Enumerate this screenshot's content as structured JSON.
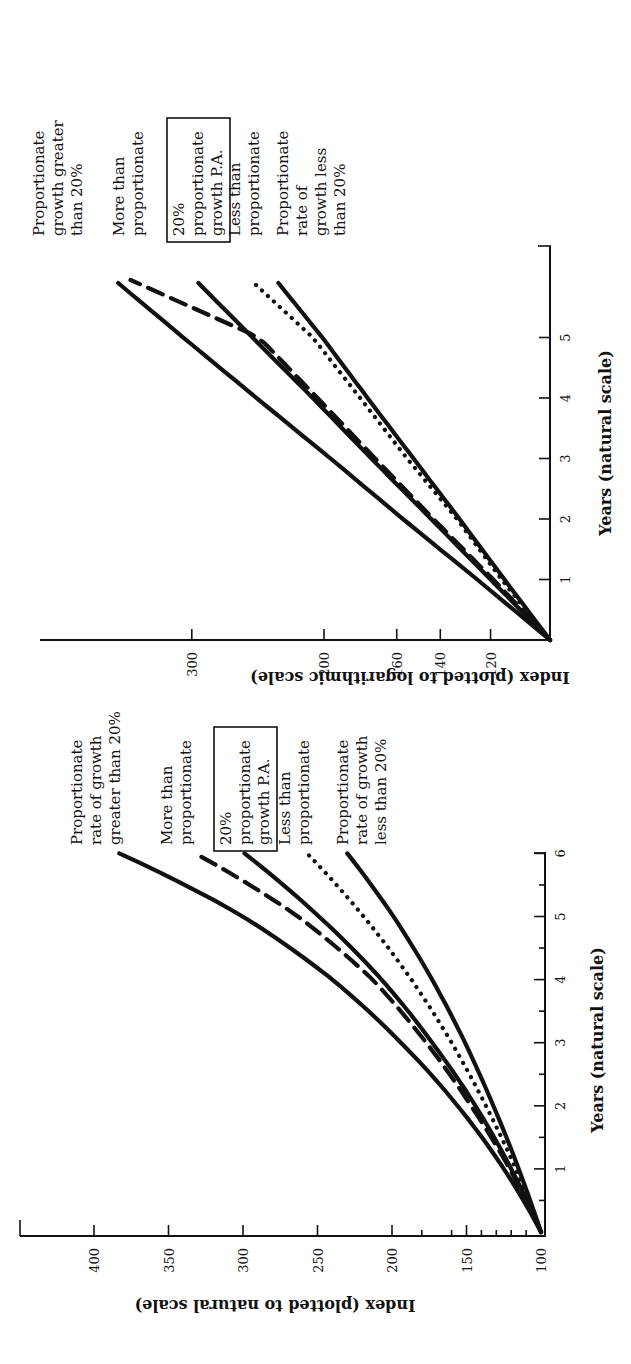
{
  "chart_data": [
    {
      "id": "log-chart",
      "type": "line",
      "title": "",
      "xlabel": "Years (natural scale)",
      "ylabel": "Index (plotted to logarithmic scale)",
      "x_ticks": [
        "1",
        "2",
        "3",
        "4",
        "5"
      ],
      "x_range": [
        0,
        6
      ],
      "y_scale": "log",
      "y_ticks": [
        "120",
        "140",
        "160",
        "200",
        "300"
      ],
      "y_tick_values": [
        120,
        140,
        160,
        200,
        300
      ],
      "y_range": [
        100,
        550
      ],
      "grid": false,
      "orientation": "rotated 90° counter-clockwise on page",
      "series": [
        {
          "name": "Proportionate growth greater than 20%",
          "style": "solid",
          "x": [
            0,
            1,
            2,
            3,
            4,
            5,
            5.9
          ],
          "values": [
            100,
            125,
            157,
            196,
            246,
            308,
            376
          ]
        },
        {
          "name": "More than proportionate",
          "style": "dashed",
          "x": [
            0,
            1,
            2,
            3,
            4,
            5,
            5.95
          ],
          "values": [
            100,
            119,
            143,
            171,
            204,
            244,
            362
          ]
        },
        {
          "name": "20% proportionate growth P.A.",
          "style": "solid",
          "x": [
            0,
            1,
            2,
            3,
            4,
            5,
            5.9
          ],
          "values": [
            100,
            120,
            144,
            173,
            207,
            249,
            294
          ]
        },
        {
          "name": "Less than proportionate",
          "style": "dotted",
          "x": [
            0,
            1,
            2,
            3,
            4,
            5,
            5.9
          ],
          "values": [
            100,
            116,
            133,
            155,
            179,
            207,
            248
          ]
        },
        {
          "name": "Proportionate rate of growth less than 20%",
          "style": "solid",
          "x": [
            0,
            1,
            2,
            3,
            4,
            5,
            5.9
          ],
          "values": [
            100,
            115,
            132,
            152,
            175,
            201,
            230
          ]
        }
      ],
      "labels": [
        {
          "lines": [
            "Proportionate",
            "growth greater",
            "than 20%"
          ],
          "boxed": false
        },
        {
          "lines": [
            "More than",
            "proportionate"
          ],
          "boxed": false
        },
        {
          "lines": [
            "20%",
            "proportionate",
            "growth P.A."
          ],
          "boxed": true
        },
        {
          "lines": [
            "Less than",
            "proportionate"
          ],
          "boxed": false
        },
        {
          "lines": [
            "Proportionate",
            "rate of",
            "growth less",
            "than 20%"
          ],
          "boxed": false
        }
      ]
    },
    {
      "id": "natural-chart",
      "type": "line",
      "title": "",
      "xlabel": "Years (natural scale)",
      "ylabel": "Index (plotted to natural scale)",
      "x_ticks": [
        "1",
        "2",
        "3",
        "4",
        "5",
        "6"
      ],
      "x_range": [
        0,
        6
      ],
      "y_scale": "linear",
      "y_ticks": [
        "100",
        "150",
        "200",
        "250",
        "300",
        "350",
        "400"
      ],
      "y_tick_values": [
        100,
        150,
        200,
        250,
        300,
        350,
        400
      ],
      "y_range": [
        100,
        430
      ],
      "grid": false,
      "orientation": "rotated 90° counter-clockwise on page",
      "series": [
        {
          "name": "Proportionate rate of growth greater than 20%",
          "style": "solid",
          "x": [
            0,
            1,
            2,
            3,
            4,
            5,
            6
          ],
          "values": [
            100,
            125,
            156,
            194,
            240,
            300,
            383
          ]
        },
        {
          "name": "More than proportionate",
          "style": "dashed",
          "x": [
            0,
            1,
            2,
            3,
            4,
            5,
            6
          ],
          "values": [
            100,
            121,
            147,
            177,
            213,
            263,
            332
          ]
        },
        {
          "name": "20% proportionate growth P.A.",
          "style": "solid",
          "x": [
            0,
            1,
            2,
            3,
            4,
            5,
            6
          ],
          "values": [
            100,
            120,
            144,
            173,
            207,
            249,
            299
          ]
        },
        {
          "name": "Less than proportionate",
          "style": "dotted",
          "x": [
            0,
            1,
            2,
            3,
            4,
            5,
            6
          ],
          "values": [
            100,
            117,
            137,
            160,
            187,
            219,
            257
          ]
        },
        {
          "name": "Proportionate rate of growth less than 20%",
          "style": "solid",
          "x": [
            0,
            1,
            2,
            3,
            4,
            5,
            6
          ],
          "values": [
            100,
            115,
            132,
            151,
            173,
            199,
            230
          ]
        }
      ],
      "labels": [
        {
          "lines": [
            "Proportionate",
            "rate of growth",
            "greater than 20%"
          ],
          "boxed": false
        },
        {
          "lines": [
            "More than",
            "proportionate"
          ],
          "boxed": false
        },
        {
          "lines": [
            "20%",
            "proportionate",
            "growth P.A."
          ],
          "boxed": true
        },
        {
          "lines": [
            "Less than",
            "proportionate"
          ],
          "boxed": false
        },
        {
          "lines": [
            "Proportionate",
            "rate of growth",
            "less than 20%"
          ],
          "boxed": false
        }
      ]
    }
  ],
  "log_chart": {
    "xlabel": "Years (natural scale)",
    "ylabel": "Index (plotted to logarithmic scale)",
    "x_ticks": [
      "1",
      "2",
      "3",
      "4",
      "5"
    ],
    "y_ticks": [
      "120",
      "140",
      "160",
      "200",
      "300"
    ]
  },
  "natural_chart": {
    "xlabel": "Years (natural scale)",
    "ylabel": "Index (plotted to natural scale)",
    "x_ticks": [
      "1",
      "2",
      "3",
      "4",
      "5",
      "6"
    ],
    "y_ticks": [
      "100",
      "150",
      "200",
      "250",
      "300",
      "350",
      "400"
    ]
  }
}
